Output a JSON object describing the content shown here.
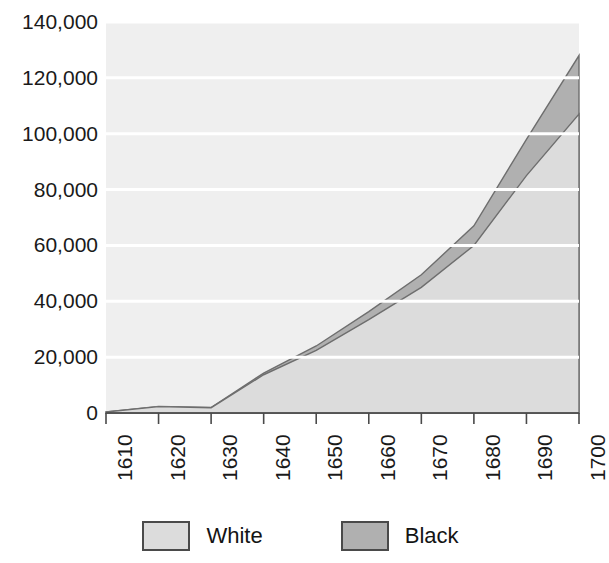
{
  "chart_data": {
    "type": "area",
    "stacked": true,
    "title": "",
    "subtitle": "",
    "xlabel": "",
    "ylabel": "",
    "x": [
      1610,
      1620,
      1630,
      1640,
      1650,
      1660,
      1670,
      1680,
      1690,
      1700
    ],
    "categories": [
      "1610",
      "1620",
      "1630",
      "1640",
      "1650",
      "1660",
      "1670",
      "1680",
      "1690",
      "1700"
    ],
    "series": [
      {
        "name": "White",
        "color": "#dcdcdc",
        "values": [
          350,
          2300,
          1900,
          13700,
          22400,
          33400,
          45000,
          60000,
          85000,
          107000
        ]
      },
      {
        "name": "Black",
        "color": "#b0b0b0",
        "values": [
          0,
          20,
          60,
          600,
          1600,
          2900,
          4500,
          7000,
          13000,
          21000
        ]
      }
    ],
    "totals": [
      350,
      2320,
      1960,
      14300,
      24000,
      36300,
      49500,
      67000,
      98000,
      128000
    ],
    "xlim": [
      1610,
      1700
    ],
    "ylim": [
      0,
      140000
    ],
    "ytick_values": [
      0,
      20000,
      40000,
      60000,
      80000,
      100000,
      120000,
      140000
    ],
    "ytick_labels": [
      "0",
      "20,000",
      "40,000",
      "60,000",
      "80,000",
      "100,000",
      "120,000",
      "140,000"
    ],
    "xtick_labels": [
      "1610",
      "1620",
      "1630",
      "1640",
      "1650",
      "1660",
      "1670",
      "1680",
      "1690",
      "1700"
    ],
    "grid": true,
    "grid_axis": "y",
    "grid_color": "#ffffff",
    "plot_background": "#efefef",
    "legend_position": "bottom",
    "legend_entries": [
      "White",
      "Black"
    ]
  },
  "legend": {
    "items": [
      {
        "label": "White",
        "color": "#dcdcdc"
      },
      {
        "label": "Black",
        "color": "#b0b0b0"
      }
    ]
  },
  "axes": {
    "y_labels": [
      "140,000",
      "120,000",
      "100,000",
      "80,000",
      "60,000",
      "40,000",
      "20,000",
      "0"
    ],
    "x_labels": [
      "1610",
      "1620",
      "1630",
      "1640",
      "1650",
      "1660",
      "1670",
      "1680",
      "1690",
      "1700"
    ]
  }
}
